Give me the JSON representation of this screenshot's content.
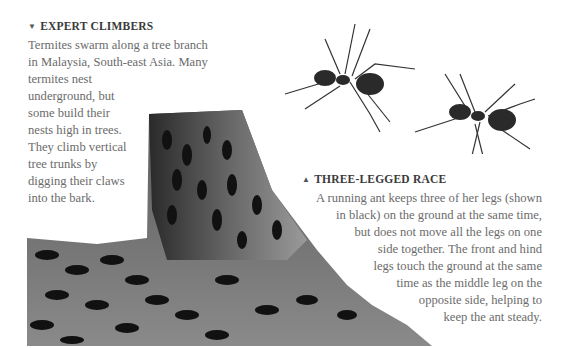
{
  "section_left": {
    "heading_icon": "triangle-down-icon",
    "heading_glyph": "▼",
    "heading": "EXPERT CLIMBERS",
    "lines": [
      "Termites swarm along a tree branch",
      "in Malaysia, South-east Asia. Many",
      "termites nest",
      "underground, but",
      "some build their",
      "nests high in trees.",
      "They climb vertical",
      "tree trunks by",
      "digging their claws",
      "into the bark."
    ]
  },
  "section_right": {
    "heading_icon": "triangle-up-icon",
    "heading_glyph": "▲",
    "heading": "THREE-LEGGED RACE",
    "lines": [
      "A running ant keeps three of her legs (shown",
      "in black) on the ground at the same time,",
      "but does not move all the legs on one",
      "side together. The front and hind",
      "legs touch the ground at the same",
      "time as the middle leg on the",
      "opposite side, helping to",
      "keep the ant steady."
    ]
  },
  "images": {
    "termite_photo": "termites-on-tree-branch",
    "ant_illustration": "two-running-ants"
  }
}
